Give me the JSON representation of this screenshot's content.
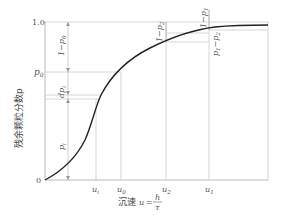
{
  "diagram": {
    "type": "settling-curve",
    "y_axis": {
      "label": "残余颗粒分数p",
      "ticks": [
        {
          "label": "1.0",
          "value": 1.0
        },
        {
          "label": "p0",
          "value": 0.72
        },
        {
          "label": "0",
          "value": 0
        }
      ]
    },
    "x_axis": {
      "label": "沉速 u = h/τ",
      "label_prefix": "沉速",
      "label_var": "u",
      "label_eq": "=",
      "frac_num": "h",
      "frac_den": "τ",
      "ticks": [
        {
          "label": "u_i",
          "sub": "i",
          "base": "u"
        },
        {
          "label": "u_0",
          "sub": "0",
          "base": "u"
        },
        {
          "label": "u_2",
          "sub": "2",
          "base": "u"
        },
        {
          "label": "u_1",
          "sub": "1",
          "base": "u"
        }
      ]
    },
    "annotations": {
      "one_minus_p0": "1−p0",
      "dp_i": "dpi",
      "p_i": "pi",
      "one_minus_p2": "1−p2",
      "one_minus_p1": "1−p1",
      "p1_minus_p2": "p1−p2"
    },
    "colors": {
      "curve": "#222222",
      "grid": "#cccccc",
      "text": "#555555"
    }
  }
}
